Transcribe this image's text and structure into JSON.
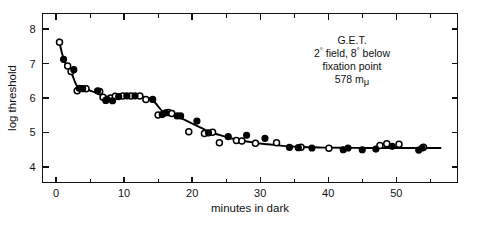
{
  "figure": {
    "background_color": "#ffffff",
    "ink_color": "#111111",
    "width": 477,
    "height": 226
  },
  "annotation": {
    "name": "G.E.T.",
    "line2_prefix": "2",
    "line2_deg1": "°",
    "line2_mid": " field, 8",
    "line2_deg2": "°",
    "line2_suffix": " below",
    "line3": "fixation point",
    "line4_value": "578 m",
    "line4_unit": "μ",
    "full_text": "G.E.T. 2° field, 8° below fixation point 578 mμ"
  },
  "chart_data": {
    "type": "scatter",
    "title": "",
    "subtitle": "",
    "xlabel": "minutes in dark",
    "ylabel": "log threshold",
    "xlim": [
      -2,
      59
    ],
    "ylim": [
      3.55,
      8.45
    ],
    "xticks": [
      0,
      10,
      20,
      30,
      40,
      50
    ],
    "xticklabels": [
      "0",
      "10",
      "20",
      "30",
      "40",
      "50"
    ],
    "xminorticks": [
      5,
      15,
      25,
      35,
      45,
      55
    ],
    "yticks": [
      4,
      5,
      6,
      7,
      8
    ],
    "yticklabels": [
      "4",
      "5",
      "6",
      "7",
      "8"
    ],
    "grid": false,
    "legend_position": "none",
    "frame": "box",
    "annotations": [
      {
        "text": "G.E.T.",
        "x": 37.5,
        "y": 7.85
      },
      {
        "text": "2° field, 8° below",
        "x": 37.5,
        "y": 7.55
      },
      {
        "text": "fixation point",
        "x": 37.5,
        "y": 7.25
      },
      {
        "text": "578 mμ",
        "x": 37.5,
        "y": 6.95
      }
    ],
    "series": [
      {
        "name": "open-circles",
        "marker": "o",
        "fill": "#ffffff",
        "edge": "#000000",
        "points": [
          [
            0.5,
            7.62
          ],
          [
            1.7,
            6.93
          ],
          [
            2.2,
            6.77
          ],
          [
            3.1,
            6.21
          ],
          [
            4.4,
            6.27
          ],
          [
            6.4,
            6.19
          ],
          [
            6.9,
            6.02
          ],
          [
            8.0,
            6.0
          ],
          [
            8.7,
            6.05
          ],
          [
            9.8,
            6.06
          ],
          [
            11.0,
            6.06
          ],
          [
            12.3,
            6.06
          ],
          [
            13.2,
            5.96
          ],
          [
            15.0,
            5.51
          ],
          [
            16.5,
            5.58
          ],
          [
            17.0,
            5.55
          ],
          [
            19.5,
            5.02
          ],
          [
            21.8,
            4.97
          ],
          [
            23.0,
            5.01
          ],
          [
            24.0,
            4.7
          ],
          [
            26.5,
            4.77
          ],
          [
            27.3,
            4.75
          ],
          [
            29.3,
            4.69
          ],
          [
            32.4,
            4.7
          ],
          [
            36.0,
            4.57
          ],
          [
            40.1,
            4.54
          ],
          [
            47.6,
            4.62
          ],
          [
            48.6,
            4.67
          ],
          [
            50.4,
            4.66
          ],
          [
            54.0,
            4.57
          ]
        ]
      },
      {
        "name": "filled-circles",
        "marker": "o",
        "fill": "#000000",
        "edge": "#000000",
        "points": [
          [
            1.1,
            7.12
          ],
          [
            2.6,
            6.82
          ],
          [
            3.4,
            6.28
          ],
          [
            3.9,
            6.27
          ],
          [
            6.1,
            6.21
          ],
          [
            7.3,
            5.93
          ],
          [
            7.5,
            5.96
          ],
          [
            8.3,
            5.92
          ],
          [
            9.2,
            6.04
          ],
          [
            10.4,
            6.06
          ],
          [
            11.6,
            6.06
          ],
          [
            14.2,
            5.96
          ],
          [
            15.6,
            5.52
          ],
          [
            16.1,
            5.57
          ],
          [
            17.8,
            5.48
          ],
          [
            18.3,
            5.48
          ],
          [
            20.7,
            5.33
          ],
          [
            22.4,
            4.99
          ],
          [
            25.3,
            4.88
          ],
          [
            28.0,
            4.92
          ],
          [
            30.7,
            4.83
          ],
          [
            34.3,
            4.57
          ],
          [
            35.6,
            4.56
          ],
          [
            37.6,
            4.55
          ],
          [
            42.2,
            4.5
          ],
          [
            42.9,
            4.55
          ],
          [
            45.0,
            4.5
          ],
          [
            47.0,
            4.52
          ],
          [
            49.4,
            4.6
          ],
          [
            53.3,
            4.49
          ],
          [
            53.8,
            4.55
          ]
        ]
      }
    ],
    "fit_curve": {
      "name": "fitted-dark-adaptation-curve",
      "color": "#000000",
      "description": "biphasic cone-rod dark adaptation curve",
      "points": [
        [
          0.4,
          7.7
        ],
        [
          0.8,
          7.35
        ],
        [
          1.2,
          7.08
        ],
        [
          1.6,
          6.92
        ],
        [
          2.0,
          6.8
        ],
        [
          2.4,
          6.66
        ],
        [
          2.8,
          6.45
        ],
        [
          3.2,
          6.3
        ],
        [
          3.7,
          6.26
        ],
        [
          4.4,
          6.25
        ],
        [
          5.2,
          6.2
        ],
        [
          6.0,
          6.14
        ],
        [
          6.8,
          6.06
        ],
        [
          7.6,
          6.0
        ],
        [
          8.4,
          5.99
        ],
        [
          9.2,
          6.02
        ],
        [
          10.2,
          6.05
        ],
        [
          11.2,
          6.06
        ],
        [
          12.2,
          6.06
        ],
        [
          13.0,
          6.03
        ],
        [
          13.8,
          5.98
        ],
        [
          14.4,
          5.9
        ],
        [
          15.0,
          5.76
        ],
        [
          15.6,
          5.62
        ],
        [
          16.2,
          5.55
        ],
        [
          17.0,
          5.5
        ],
        [
          18.0,
          5.44
        ],
        [
          19.0,
          5.36
        ],
        [
          20.0,
          5.26
        ],
        [
          21.0,
          5.16
        ],
        [
          22.0,
          5.07
        ],
        [
          23.0,
          4.99
        ],
        [
          24.0,
          4.93
        ],
        [
          25.0,
          4.87
        ],
        [
          26.0,
          4.82
        ],
        [
          27.0,
          4.78
        ],
        [
          28.0,
          4.74
        ],
        [
          29.0,
          4.71
        ],
        [
          30.0,
          4.68
        ],
        [
          31.0,
          4.66
        ],
        [
          32.0,
          4.64
        ],
        [
          33.0,
          4.62
        ],
        [
          34.0,
          4.6
        ],
        [
          35.0,
          4.59
        ],
        [
          36.0,
          4.58
        ],
        [
          38.0,
          4.57
        ],
        [
          40.0,
          4.56
        ],
        [
          43.0,
          4.555
        ],
        [
          46.0,
          4.552
        ],
        [
          50.0,
          4.55
        ],
        [
          54.0,
          4.55
        ],
        [
          56.5,
          4.55
        ]
      ]
    }
  }
}
